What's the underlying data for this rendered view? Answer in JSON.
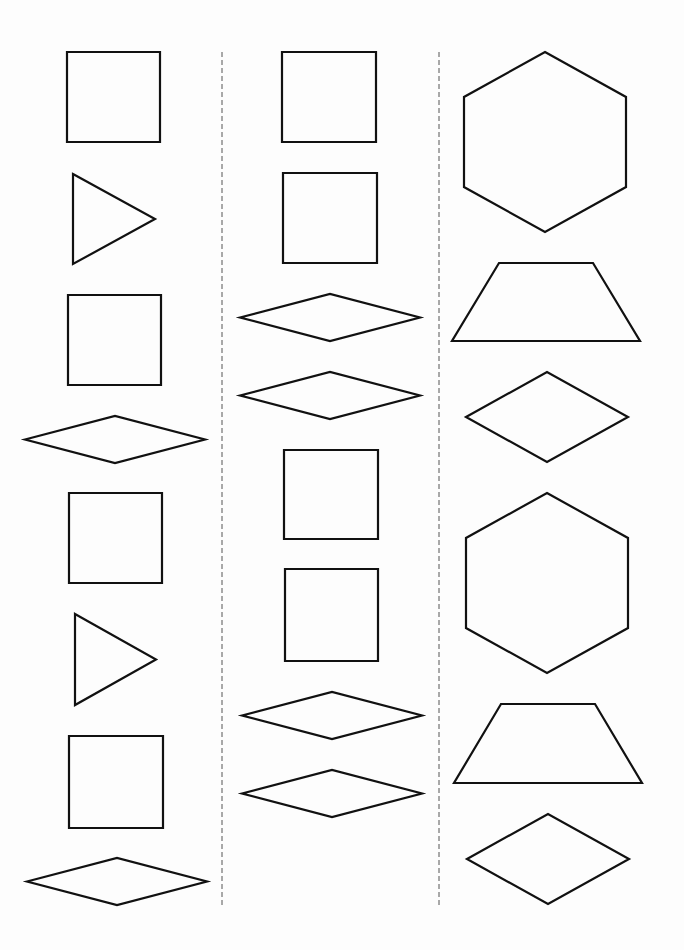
{
  "worksheet": {
    "type": "pattern-block shape sequence",
    "colors": {
      "background": "#fdfdfd",
      "shape_stroke": "#111111",
      "divider": "#555555"
    },
    "columns": [
      {
        "name": "left",
        "shapes": [
          "square",
          "triangle",
          "square",
          "rhombus",
          "square",
          "triangle",
          "square",
          "rhombus"
        ]
      },
      {
        "name": "middle",
        "shapes": [
          "square",
          "square",
          "rhombus",
          "rhombus",
          "square",
          "square",
          "rhombus",
          "rhombus"
        ]
      },
      {
        "name": "right",
        "shapes": [
          "hexagon",
          "trapezoid",
          "rhombus",
          "hexagon",
          "trapezoid",
          "rhombus"
        ]
      }
    ]
  }
}
